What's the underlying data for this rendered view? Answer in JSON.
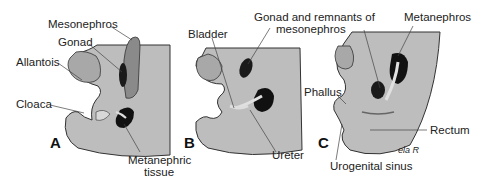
{
  "figure": {
    "panels": [
      {
        "letter": "A",
        "labels": {
          "mesonephros": "Mesonephros",
          "gonad": "Gonad",
          "allantois": "Allantois",
          "cloaca": "Cloaca",
          "metanephric1": "Metanephric",
          "metanephric2": "tissue"
        }
      },
      {
        "letter": "B",
        "labels": {
          "bladder": "Bladder",
          "gonad_remnants1": "Gonad and remnants of",
          "gonad_remnants2": "mesonephros",
          "ureter": "Ureter"
        }
      },
      {
        "letter": "C",
        "labels": {
          "metanephros": "Metanephros",
          "phallus": "Phallus",
          "rectum": "Rectum",
          "urogenital_sinus": "Urogenital sinus"
        }
      }
    ],
    "signature": "ela R",
    "colors": {
      "body": "#bdbdbd",
      "inner": "#a8a8a8",
      "dark_organ": "#111111",
      "light_tissue": "#d8d8d8",
      "outline": "#333333"
    }
  }
}
